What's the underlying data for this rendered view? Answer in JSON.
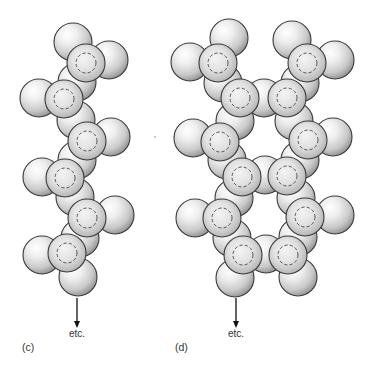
{
  "figure": {
    "panels": [
      {
        "id": "c",
        "label": "(c)",
        "continuation_label": "etc.",
        "structure": "single chain",
        "arrow": {
          "x": 77,
          "y1": 298,
          "y2": 328
        },
        "etc_pos": {
          "x": 77,
          "y": 337
        },
        "label_pos": {
          "x": 22,
          "y": 351
        },
        "back_spheres": [
          {
            "cx": 73,
            "cy": 42
          },
          {
            "cx": 109,
            "cy": 60
          },
          {
            "cx": 77,
            "cy": 82
          },
          {
            "cx": 39,
            "cy": 98
          },
          {
            "cx": 76,
            "cy": 120
          },
          {
            "cx": 111,
            "cy": 137
          },
          {
            "cx": 77,
            "cy": 160
          },
          {
            "cx": 42,
            "cy": 177
          },
          {
            "cx": 75,
            "cy": 197
          },
          {
            "cx": 115,
            "cy": 215
          },
          {
            "cx": 80,
            "cy": 238
          },
          {
            "cx": 42,
            "cy": 255
          },
          {
            "cx": 78,
            "cy": 277
          }
        ],
        "front_spheres": [
          {
            "cx": 86,
            "cy": 63
          },
          {
            "cx": 64,
            "cy": 99
          },
          {
            "cx": 87,
            "cy": 141
          },
          {
            "cx": 65,
            "cy": 178
          },
          {
            "cx": 87,
            "cy": 218
          },
          {
            "cx": 67,
            "cy": 253
          }
        ]
      },
      {
        "id": "d",
        "label": "(d)",
        "continuation_label": "etc.",
        "structure": "double chain",
        "arrow": {
          "x": 236,
          "y1": 298,
          "y2": 328
        },
        "etc_pos": {
          "x": 236,
          "y": 337
        },
        "label_pos": {
          "x": 175,
          "y": 351
        },
        "back_spheres": [
          {
            "cx": 229,
            "cy": 38
          },
          {
            "cx": 292,
            "cy": 40
          },
          {
            "cx": 190,
            "cy": 62
          },
          {
            "cx": 335,
            "cy": 60
          },
          {
            "cx": 223,
            "cy": 83
          },
          {
            "cx": 300,
            "cy": 83
          },
          {
            "cx": 264,
            "cy": 98
          },
          {
            "cx": 235,
            "cy": 121
          },
          {
            "cx": 294,
            "cy": 121
          },
          {
            "cx": 193,
            "cy": 138
          },
          {
            "cx": 333,
            "cy": 137
          },
          {
            "cx": 227,
            "cy": 160
          },
          {
            "cx": 300,
            "cy": 160
          },
          {
            "cx": 265,
            "cy": 175
          },
          {
            "cx": 234,
            "cy": 198
          },
          {
            "cx": 296,
            "cy": 198
          },
          {
            "cx": 195,
            "cy": 218
          },
          {
            "cx": 335,
            "cy": 215
          },
          {
            "cx": 232,
            "cy": 238
          },
          {
            "cx": 298,
            "cy": 237
          },
          {
            "cx": 266,
            "cy": 254
          },
          {
            "cx": 235,
            "cy": 278
          },
          {
            "cx": 298,
            "cy": 277
          }
        ],
        "front_spheres": [
          {
            "cx": 218,
            "cy": 63
          },
          {
            "cx": 307,
            "cy": 63
          },
          {
            "cx": 240,
            "cy": 98
          },
          {
            "cx": 287,
            "cy": 98
          },
          {
            "cx": 220,
            "cy": 142
          },
          {
            "cx": 308,
            "cy": 140
          },
          {
            "cx": 242,
            "cy": 177
          },
          {
            "cx": 287,
            "cy": 176
          },
          {
            "cx": 222,
            "cy": 218
          },
          {
            "cx": 305,
            "cy": 217
          },
          {
            "cx": 243,
            "cy": 255
          },
          {
            "cx": 288,
            "cy": 255
          }
        ]
      }
    ],
    "stray_dot": {
      "x": 155,
      "y": 137
    }
  },
  "style": {
    "sphere_radius": 19,
    "dashed_ring_radius": 10,
    "sphere_highlight": "#ffffff",
    "sphere_mid": "#d9d9d9",
    "sphere_shadow": "#8a8a8a",
    "outline": "#3a3a3a"
  }
}
